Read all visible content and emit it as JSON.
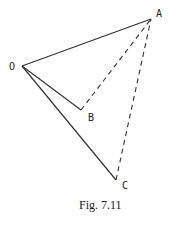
{
  "figure": {
    "caption": "Fig. 7.11",
    "points": {
      "O": {
        "label": "O",
        "x": 22,
        "y": 66
      },
      "A": {
        "label": "A",
        "x": 151,
        "y": 19
      },
      "B": {
        "label": "B",
        "x": 81,
        "y": 110
      },
      "C": {
        "label": "C",
        "x": 116,
        "y": 180
      }
    },
    "solid_segments": [
      [
        "O",
        "A"
      ],
      [
        "O",
        "B"
      ],
      [
        "O",
        "C"
      ]
    ],
    "dashed_segments": [
      [
        "B",
        "A"
      ],
      [
        "C",
        "A"
      ]
    ],
    "colors": {
      "stroke": "#333333",
      "background": "#ffffff"
    }
  }
}
